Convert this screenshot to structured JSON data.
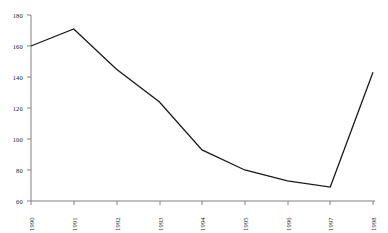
{
  "chart_data": {
    "type": "line",
    "title": "",
    "subtitle": "",
    "xlabel": "",
    "ylabel": "",
    "categories": [
      "1990",
      "1991",
      "1992",
      "1993",
      "1994",
      "1995",
      "1996",
      "1997",
      "1998"
    ],
    "values": [
      160,
      171,
      145,
      124,
      93,
      80,
      73,
      69,
      143
    ],
    "series": [
      {
        "name": "",
        "values": [
          160,
          171,
          145,
          124,
          93,
          80,
          73,
          69,
          143
        ]
      }
    ],
    "ylim": [
      60,
      180
    ],
    "ytick_labels": [
      "60",
      "80",
      "100",
      "120",
      "140",
      "160",
      "180"
    ],
    "ytick_values": [
      60,
      80,
      100,
      120,
      140,
      160,
      180
    ],
    "xtick_labels": [
      "1990",
      "1991",
      "1992",
      "1993",
      "1994",
      "1995",
      "1996",
      "1997",
      "1998"
    ],
    "grid": false,
    "legend": false,
    "legend_position": "none",
    "line_color": "#1a1a1a",
    "axis_color": "#808080",
    "background_color": "#ffffff",
    "xtick_label_rotation": "90"
  }
}
